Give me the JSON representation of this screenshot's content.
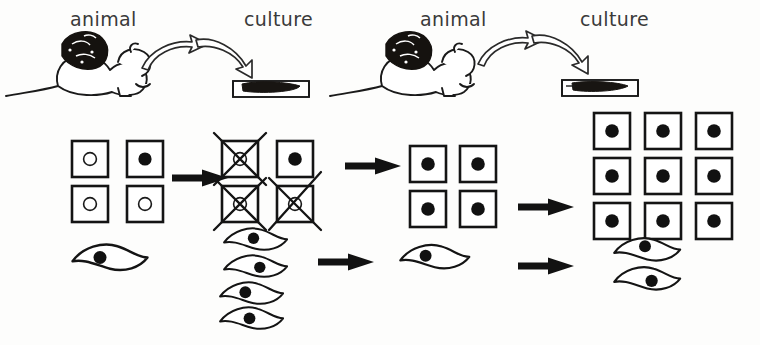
{
  "figure": {
    "background_color": "#fdfdfc",
    "ink_color": "#141414",
    "style": "hand-drawn line diagram"
  },
  "top_row": {
    "labels": [
      {
        "text": "animal",
        "x": 70,
        "y": 10
      },
      {
        "text": "culture",
        "x": 244,
        "y": 10
      },
      {
        "text": "animal",
        "x": 420,
        "y": 10
      },
      {
        "text": "culture",
        "x": 580,
        "y": 10
      }
    ],
    "stages": [
      {
        "kind": "animal",
        "name": "mouse-with-tumor-1",
        "description": "mouse bearing a large dark tumour mass"
      },
      {
        "kind": "culture",
        "name": "culture-dish-1",
        "description": "side view culture dish with dark cell mass"
      },
      {
        "kind": "animal",
        "name": "mouse-with-tumor-2",
        "description": "mouse bearing a large dark tumour mass"
      },
      {
        "kind": "culture",
        "name": "culture-dish-2",
        "description": "side view culture dish with dark cell mass"
      }
    ],
    "curved_arrows_count": 4
  },
  "cell_rows": {
    "legend": {
      "square_cell": "epithelial cell drawn as a square",
      "spindle_cell": "fibroblast-like cell drawn as a wavy spindle",
      "filled_nucleus": "transformed / tumour cell nucleus (solid black)",
      "hollow_nucleus": "normal cell nucleus (open circle)",
      "crossed_out": "cell that fails to survive the passage"
    },
    "groups": [
      {
        "name": "group-1-initial-population",
        "squares": {
          "columns": 2,
          "rows": 2,
          "cells": [
            {
              "nucleus": "hollow",
              "crossed": false
            },
            {
              "nucleus": "filled",
              "crossed": false
            },
            {
              "nucleus": "hollow",
              "crossed": false
            },
            {
              "nucleus": "hollow",
              "crossed": false
            }
          ]
        },
        "spindles": [
          {
            "nucleus": "filled"
          }
        ]
      },
      {
        "name": "group-2-selection",
        "squares": {
          "columns": 2,
          "rows": 2,
          "cells": [
            {
              "nucleus": "hollow",
              "crossed": true
            },
            {
              "nucleus": "filled",
              "crossed": false
            },
            {
              "nucleus": "hollow",
              "crossed": true
            },
            {
              "nucleus": "hollow",
              "crossed": true
            }
          ]
        },
        "spindles": [
          {
            "nucleus": "filled"
          },
          {
            "nucleus": "filled"
          },
          {
            "nucleus": "filled"
          },
          {
            "nucleus": "filled"
          }
        ]
      },
      {
        "name": "group-3-expanded-transformed",
        "squares": {
          "columns": 2,
          "rows": 2,
          "cells": [
            {
              "nucleus": "filled",
              "crossed": false
            },
            {
              "nucleus": "filled",
              "crossed": false
            },
            {
              "nucleus": "filled",
              "crossed": false
            },
            {
              "nucleus": "filled",
              "crossed": false
            }
          ]
        },
        "spindles": [
          {
            "nucleus": "filled"
          }
        ]
      },
      {
        "name": "group-4-final-outgrowth",
        "squares": {
          "columns": 3,
          "rows": 3,
          "cells": [
            {
              "nucleus": "filled",
              "crossed": false
            },
            {
              "nucleus": "filled",
              "crossed": false
            },
            {
              "nucleus": "filled",
              "crossed": false
            },
            {
              "nucleus": "filled",
              "crossed": false
            },
            {
              "nucleus": "filled",
              "crossed": false
            },
            {
              "nucleus": "filled",
              "crossed": false
            },
            {
              "nucleus": "filled",
              "crossed": false
            },
            {
              "nucleus": "filled",
              "crossed": false
            },
            {
              "nucleus": "filled",
              "crossed": false
            }
          ]
        },
        "spindles": [
          {
            "nucleus": "filled"
          },
          {
            "nucleus": "filled"
          }
        ]
      }
    ],
    "straight_arrows": [
      {
        "name": "arrow-squares-1-to-2",
        "x": 160,
        "y": 175
      },
      {
        "name": "arrow-squares-2-to-3",
        "x": 347,
        "y": 163
      },
      {
        "name": "arrow-spindles-2-to-3",
        "x": 312,
        "y": 258
      },
      {
        "name": "arrow-squares-3-to-4",
        "x": 512,
        "y": 203
      },
      {
        "name": "arrow-spindles-3-to-4",
        "x": 512,
        "y": 262
      }
    ]
  }
}
